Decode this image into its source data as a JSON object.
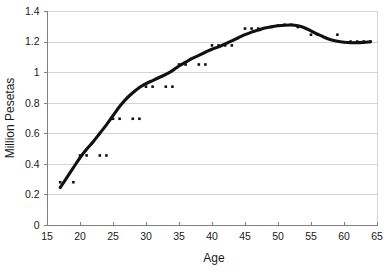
{
  "chart_data": {
    "type": "scatter",
    "title": "",
    "subtitle": "",
    "xlabel": "Age",
    "ylabel": "Million Pesetas",
    "xlim": [
      15,
      65
    ],
    "ylim": [
      0,
      1.4
    ],
    "grid": "horizontal",
    "legend": "none",
    "xticks": [
      "15",
      "20",
      "25",
      "30",
      "35",
      "40",
      "45",
      "50",
      "55",
      "60",
      "65"
    ],
    "xtick_values": [
      15,
      20,
      25,
      30,
      35,
      40,
      45,
      50,
      55,
      60,
      65
    ],
    "yticks": [
      "0",
      "0.2",
      "0.4",
      "0.6",
      "0.8",
      "1",
      "1.2",
      "1.4"
    ],
    "ytick_values": [
      0,
      0.2,
      0.4,
      0.6,
      0.8,
      1,
      1.2,
      1.4
    ],
    "series": [
      {
        "name": "observations",
        "marker": "small-square-dot",
        "color": "#111111",
        "points": [
          [
            17,
            0.28
          ],
          [
            19,
            0.28
          ],
          [
            20,
            0.455
          ],
          [
            21,
            0.455
          ],
          [
            23,
            0.455
          ],
          [
            24,
            0.455
          ],
          [
            25,
            0.695
          ],
          [
            26,
            0.695
          ],
          [
            28,
            0.695
          ],
          [
            29,
            0.695
          ],
          [
            30,
            0.905
          ],
          [
            31,
            0.905
          ],
          [
            33,
            0.905
          ],
          [
            34,
            0.905
          ],
          [
            35,
            1.05
          ],
          [
            36,
            1.05
          ],
          [
            38,
            1.05
          ],
          [
            39,
            1.05
          ],
          [
            40,
            1.175
          ],
          [
            41,
            1.175
          ],
          [
            42,
            1.175
          ],
          [
            43,
            1.175
          ],
          [
            45,
            1.285
          ],
          [
            46,
            1.285
          ],
          [
            47,
            1.285
          ],
          [
            49,
            1.295
          ],
          [
            50,
            1.305
          ],
          [
            51,
            1.31
          ],
          [
            52,
            1.31
          ],
          [
            53,
            1.295
          ],
          [
            55,
            1.245
          ],
          [
            56,
            1.245
          ],
          [
            59,
            1.245
          ],
          [
            61,
            1.2
          ],
          [
            62,
            1.2
          ],
          [
            63,
            1.2
          ],
          [
            64,
            1.2
          ]
        ]
      },
      {
        "name": "smoothed-fit",
        "marker": "none",
        "color": "#111111",
        "points": [
          [
            17,
            0.245
          ],
          [
            18,
            0.31
          ],
          [
            19,
            0.375
          ],
          [
            20,
            0.44
          ],
          [
            21,
            0.495
          ],
          [
            22,
            0.545
          ],
          [
            23,
            0.6
          ],
          [
            24,
            0.655
          ],
          [
            25,
            0.715
          ],
          [
            26,
            0.775
          ],
          [
            27,
            0.825
          ],
          [
            28,
            0.865
          ],
          [
            29,
            0.9
          ],
          [
            30,
            0.925
          ],
          [
            31,
            0.945
          ],
          [
            32,
            0.965
          ],
          [
            33,
            0.985
          ],
          [
            34,
            1.01
          ],
          [
            35,
            1.04
          ],
          [
            36,
            1.065
          ],
          [
            37,
            1.09
          ],
          [
            38,
            1.11
          ],
          [
            39,
            1.13
          ],
          [
            40,
            1.15
          ],
          [
            41,
            1.165
          ],
          [
            42,
            1.185
          ],
          [
            43,
            1.205
          ],
          [
            44,
            1.225
          ],
          [
            45,
            1.245
          ],
          [
            46,
            1.262
          ],
          [
            47,
            1.275
          ],
          [
            48,
            1.288
          ],
          [
            49,
            1.297
          ],
          [
            50,
            1.303
          ],
          [
            51,
            1.307
          ],
          [
            52,
            1.308
          ],
          [
            53,
            1.303
          ],
          [
            54,
            1.29
          ],
          [
            55,
            1.27
          ],
          [
            56,
            1.248
          ],
          [
            57,
            1.228
          ],
          [
            58,
            1.212
          ],
          [
            59,
            1.202
          ],
          [
            60,
            1.196
          ],
          [
            61,
            1.193
          ],
          [
            62,
            1.193
          ],
          [
            63,
            1.195
          ],
          [
            64,
            1.198
          ]
        ]
      }
    ]
  },
  "labels": {
    "x_axis_title": "Age",
    "y_axis_title": "Million Pesetas"
  }
}
